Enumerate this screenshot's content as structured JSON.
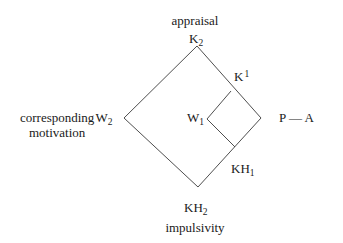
{
  "diagram": {
    "colors": {
      "line": "#3a3a3a",
      "text": "#1a1a1a",
      "background": "#ffffff"
    },
    "labels": {
      "top_caption": "appraisal",
      "top_node": {
        "base": "K",
        "sub": "2"
      },
      "upper_right_node": {
        "base": "K",
        "sup": "1"
      },
      "inner_left_node": {
        "base": "W",
        "sub": "1"
      },
      "left_caption_line1": "corresponding",
      "left_node": {
        "base": "W",
        "sub": "2"
      },
      "left_caption_line2": "motivation",
      "right_caption": "P — A",
      "lower_right_node": {
        "base": "KH",
        "sub": "1"
      },
      "bottom_node": {
        "base": "KH",
        "sub": "2"
      },
      "bottom_caption": "impulsivity"
    },
    "shapes": {
      "outer_diamond": {
        "top": [
          197,
          46
        ],
        "right": [
          261,
          118
        ],
        "bottom": [
          198,
          187
        ],
        "left": [
          124,
          118
        ]
      },
      "inner_diamond": {
        "top": [
          231,
          91
        ],
        "right": [
          261,
          118
        ],
        "bottom": [
          235,
          147
        ],
        "left": [
          207,
          119
        ]
      }
    }
  }
}
